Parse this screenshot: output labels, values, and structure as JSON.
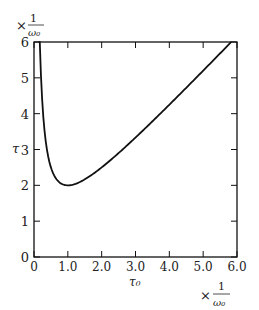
{
  "chart_data": {
    "type": "line",
    "title": "",
    "xlabel": "τ₀",
    "ylabel": "τ",
    "x_unit": "× 1/ω₀",
    "y_unit": "× 1/ω₀",
    "xlim": [
      0,
      6
    ],
    "ylim": [
      0,
      6
    ],
    "x_ticks": [
      "0",
      "1.0",
      "2.0",
      "3.0",
      "4.0",
      "5.0",
      "6.0"
    ],
    "y_ticks": [
      "0",
      "1",
      "2",
      "3",
      "4",
      "5",
      "6"
    ],
    "grid": false,
    "legend": null,
    "series": [
      {
        "name": "τ = τ₀ + 1/τ₀",
        "x": [
          0.17,
          0.2,
          0.25,
          0.3,
          0.4,
          0.5,
          0.6,
          0.7,
          0.8,
          0.9,
          1.0,
          1.2,
          1.5,
          2.0,
          2.5,
          3.0,
          3.5,
          4.0,
          4.5,
          5.0,
          5.5,
          5.83
        ],
        "values": [
          6.05,
          5.2,
          4.25,
          3.63,
          2.9,
          2.5,
          2.27,
          2.13,
          2.05,
          2.01,
          2.0,
          2.03,
          2.17,
          2.5,
          2.9,
          3.33,
          3.79,
          4.25,
          4.72,
          5.2,
          5.68,
          6.0
        ]
      }
    ]
  },
  "labels": {
    "y_axis_symbol": "τ",
    "x_axis_symbol": "τ₀",
    "unit_prefix": "×",
    "unit_num": "1",
    "unit_den": "ω₀"
  }
}
